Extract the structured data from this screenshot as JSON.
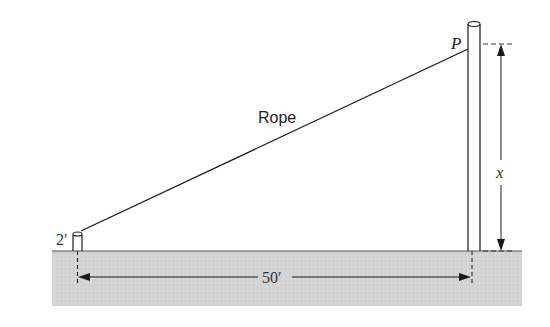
{
  "diagram": {
    "labels": {
      "rope": "Rope",
      "point": "P",
      "short_post_height": "2′",
      "distance": "50′",
      "tall_post_height": "x"
    },
    "colors": {
      "ground": "#d6d6d6",
      "line": "#1a1a1a",
      "background": "#ffffff"
    }
  }
}
